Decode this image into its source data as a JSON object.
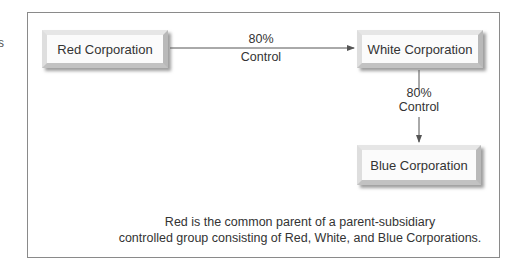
{
  "edge_fragment": "s",
  "entities": [
    {
      "id": "red",
      "label": "Red Corporation"
    },
    {
      "id": "white",
      "label": "White Corporation"
    },
    {
      "id": "blue",
      "label": "Blue Corporation"
    }
  ],
  "edges": [
    {
      "from": "red",
      "to": "white",
      "percent": "80%",
      "relation": "Control"
    },
    {
      "from": "white",
      "to": "blue",
      "percent": "80%",
      "relation": "Control"
    }
  ],
  "caption": {
    "line1": "Red is the common parent of a parent-subsidiary",
    "line2": "controlled group consisting of Red, White, and Blue Corporations."
  },
  "colors": {
    "frame": "#8a8a8a",
    "connector": "#555555",
    "box_face": "#fbfbfb",
    "text": "#333333"
  }
}
